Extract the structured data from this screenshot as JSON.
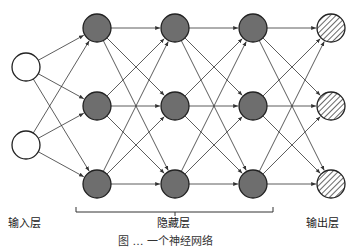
{
  "diagram": {
    "type": "neural-network",
    "layers": [
      {
        "name": "input",
        "label": "输入层",
        "x": 26,
        "nodes": [
          67,
          145
        ],
        "fill": "#ffffff",
        "style": "plain"
      },
      {
        "name": "hidden-1",
        "x": 97,
        "nodes": [
          28,
          106,
          184
        ],
        "fill": "#6e6e6e",
        "style": "solid"
      },
      {
        "name": "hidden-2",
        "x": 175,
        "nodes": [
          28,
          106,
          184
        ],
        "fill": "#6e6e6e",
        "style": "solid"
      },
      {
        "name": "hidden-3",
        "x": 253,
        "nodes": [
          28,
          106,
          184
        ],
        "fill": "#6e6e6e",
        "style": "solid"
      },
      {
        "name": "output",
        "label": "输出层",
        "x": 331,
        "nodes": [
          28,
          106,
          184
        ],
        "fill": "#ffffff",
        "style": "hatched"
      }
    ],
    "hidden_label": "隐藏层",
    "node_radius": 14,
    "edge_color": "#333333",
    "connection": "fully-connected"
  },
  "labels": {
    "input": "输入层",
    "hidden": "隐藏层",
    "output": "输出层"
  },
  "caption": "图 … 一个神经网络"
}
